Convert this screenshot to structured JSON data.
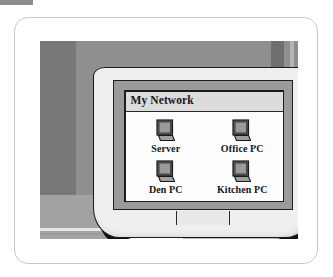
{
  "figure": {
    "kind": "crt-monitor-illustration"
  },
  "window": {
    "title": "My Network",
    "icons": [
      {
        "label": "Server",
        "icon": "computer-icon"
      },
      {
        "label": "Office PC",
        "icon": "computer-icon"
      },
      {
        "label": "Den PC",
        "icon": "computer-icon"
      },
      {
        "label": "Kitchen PC",
        "icon": "computer-icon"
      }
    ]
  },
  "colors": {
    "page_background": "#ffffff",
    "card_border": "#c9c9c9",
    "backdrop_gray": "#8f8f8f",
    "desk_gray": "#a2a2a2",
    "monitor_case": "#efefef",
    "monitor_bezel": "#9b9b9b",
    "screen_rim": "#1c1c1c",
    "window_background": "#fdfdfd",
    "title_bar": "#dcdcdc",
    "text": "#16181c",
    "icon_screen": "#8c8c8c",
    "icon_outline": "#1a1a1a"
  }
}
